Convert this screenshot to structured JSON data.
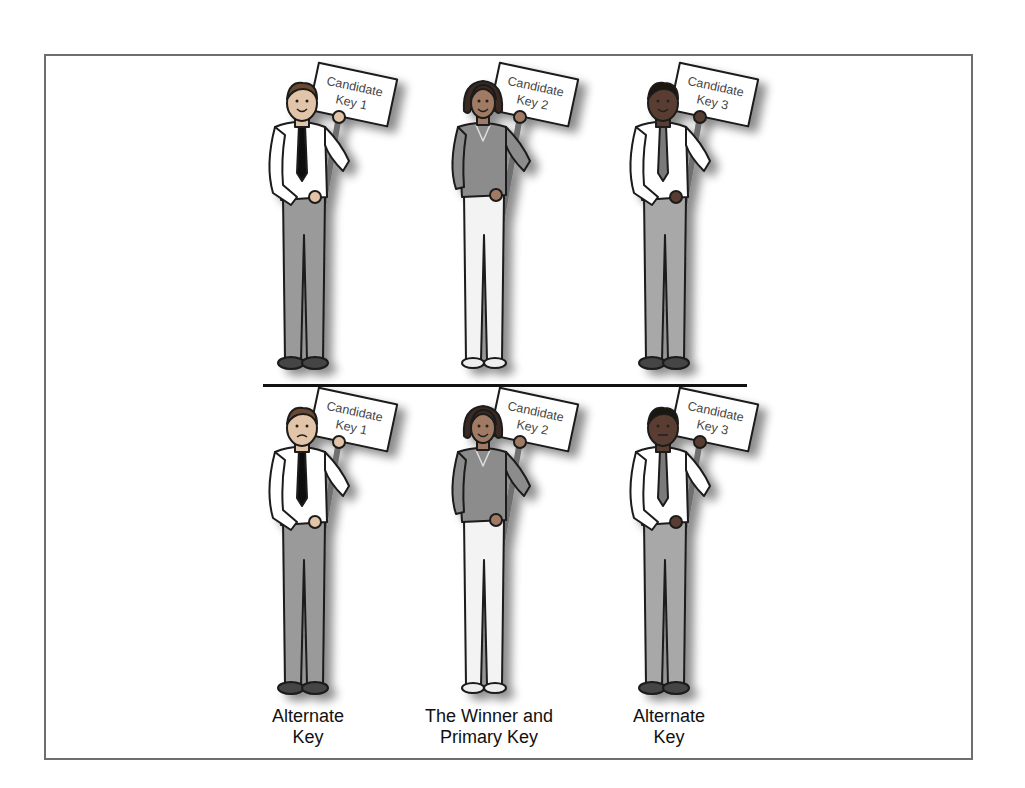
{
  "diagram": {
    "top_row": {
      "figures": [
        {
          "sign_line1": "Candidate",
          "sign_line2": "Key 1",
          "person": "man-light-skin",
          "shirt": "#ffffff",
          "pants": "#9a9a9a",
          "tie": "#111111",
          "expression": "smiling"
        },
        {
          "sign_line1": "Candidate",
          "sign_line2": "Key 2",
          "person": "woman",
          "shirt": "#8c8c8c",
          "pants": "#f2f2f2",
          "expression": "smiling"
        },
        {
          "sign_line1": "Candidate",
          "sign_line2": "Key 3",
          "person": "man-dark-skin",
          "shirt": "#ffffff",
          "pants": "#a8a8a8",
          "tie": "#7a7a7a",
          "expression": "smiling"
        }
      ]
    },
    "bottom_row": {
      "figures": [
        {
          "sign_line1": "Candidate",
          "sign_line2": "Key 1",
          "person": "man-light-skin",
          "expression": "sad",
          "caption_line1": "Alternate",
          "caption_line2": "Key"
        },
        {
          "sign_line1": "Candidate",
          "sign_line2": "Key 2",
          "person": "woman",
          "expression": "smiling",
          "caption_line1": "The Winner and",
          "caption_line2": "Primary Key"
        },
        {
          "sign_line1": "Candidate",
          "sign_line2": "Key 3",
          "person": "man-dark-skin",
          "expression": "neutral",
          "caption_line1": "Alternate",
          "caption_line2": "Key"
        }
      ]
    },
    "colors": {
      "border": "#6e6e6e",
      "divider": "#111111",
      "background": "#ffffff"
    }
  }
}
